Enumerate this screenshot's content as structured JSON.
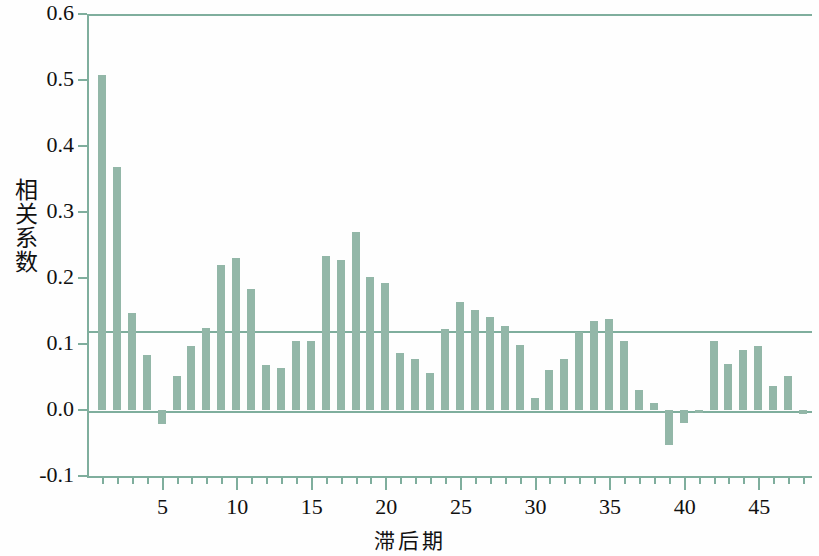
{
  "chart_data": {
    "type": "bar",
    "title": "",
    "xlabel": "滞后期",
    "ylabel": "相关系数",
    "ylim": [
      -0.1,
      0.6
    ],
    "xlim": [
      0,
      48
    ],
    "grid": false,
    "legend": null,
    "yticks": [
      "0.6",
      "0.5",
      "0.4",
      "0.3",
      "0.2",
      "0.1",
      "0.0",
      "-0.1"
    ],
    "ytick_values": [
      0.6,
      0.5,
      0.4,
      0.3,
      0.2,
      0.1,
      0.0,
      -0.1
    ],
    "xticks": [
      "5",
      "10",
      "15",
      "20",
      "25",
      "30",
      "35",
      "40",
      "45"
    ],
    "xtick_values": [
      5,
      10,
      15,
      20,
      25,
      30,
      35,
      40,
      45
    ],
    "bar_color": "#93b7a8",
    "axis_color": "#7fae9d",
    "significance_line": 0.121,
    "categories": [
      1,
      2,
      3,
      4,
      5,
      6,
      7,
      8,
      9,
      10,
      11,
      12,
      13,
      14,
      15,
      16,
      17,
      18,
      19,
      20,
      21,
      22,
      23,
      24,
      25,
      26,
      27,
      28,
      29,
      30,
      31,
      32,
      33,
      34,
      35,
      36,
      37,
      38,
      39,
      40,
      41,
      42,
      43,
      44,
      45,
      46,
      47,
      48
    ],
    "values": [
      0.507,
      0.368,
      0.147,
      0.083,
      -0.021,
      0.051,
      0.097,
      0.124,
      0.219,
      0.23,
      0.184,
      0.068,
      0.063,
      0.104,
      0.104,
      0.233,
      0.228,
      0.27,
      0.202,
      0.192,
      0.086,
      0.077,
      0.056,
      0.122,
      0.163,
      0.152,
      0.141,
      0.127,
      0.098,
      0.018,
      0.06,
      0.077,
      0.118,
      0.135,
      0.138,
      0.104,
      0.031,
      0.01,
      -0.053,
      -0.019,
      -0.005,
      0.105,
      0.069,
      0.091,
      0.097,
      0.037,
      0.052,
      -0.006
    ]
  },
  "axis": {
    "ylabel_text": "相关系数",
    "xlabel_text": "滞后期"
  }
}
